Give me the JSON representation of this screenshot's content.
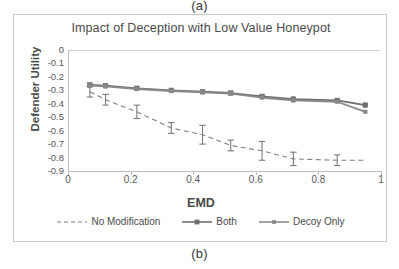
{
  "figure": {
    "caption_top": "(a)",
    "caption_bottom": "(b)"
  },
  "chart_data": {
    "type": "line",
    "title": "Impact of Deception with Low Value Honeypot",
    "xlabel": "EMD",
    "ylabel": "Defender Utility",
    "xlim": [
      0,
      1
    ],
    "ylim": [
      -0.9,
      0
    ],
    "xticks": [
      "0",
      "0.2",
      "0.4",
      "0.6",
      "0.8",
      "1"
    ],
    "xtick_values": [
      0,
      0.2,
      0.4,
      0.6,
      0.8,
      1
    ],
    "yticks": [
      "0",
      "-0.1",
      "-0.2",
      "-0.3",
      "-0.4",
      "-0.5",
      "-0.6",
      "-0.7",
      "-0.8",
      "-0.9"
    ],
    "ytick_values": [
      0,
      -0.1,
      -0.2,
      -0.3,
      -0.4,
      -0.5,
      -0.6,
      -0.7,
      -0.8,
      -0.9
    ],
    "grid": false,
    "legend_position": "bottom",
    "series": [
      {
        "name": "No Modification",
        "style": "dashed",
        "marker": "none",
        "color": "#7f7f7f",
        "error_bars": true,
        "x": [
          0.07,
          0.12,
          0.22,
          0.33,
          0.43,
          0.52,
          0.62,
          0.72,
          0.86,
          0.95
        ],
        "values": [
          -0.31,
          -0.37,
          -0.46,
          -0.58,
          -0.63,
          -0.71,
          -0.75,
          -0.81,
          -0.82,
          -0.82
        ],
        "yerr": [
          0.04,
          0.04,
          0.05,
          0.04,
          0.07,
          0.04,
          0.07,
          0.05,
          0.04,
          0.0
        ]
      },
      {
        "name": "Both",
        "style": "solid",
        "marker": "square",
        "color": "#6e6e6e",
        "error_bars": false,
        "x": [
          0.07,
          0.12,
          0.22,
          0.33,
          0.43,
          0.52,
          0.62,
          0.72,
          0.86,
          0.95
        ],
        "values": [
          -0.26,
          -0.265,
          -0.285,
          -0.3,
          -0.31,
          -0.32,
          -0.345,
          -0.365,
          -0.375,
          -0.41
        ]
      },
      {
        "name": "Decoy Only",
        "style": "solid",
        "marker": "small-square",
        "color": "#8a8a8a",
        "error_bars": false,
        "x": [
          0.07,
          0.12,
          0.22,
          0.33,
          0.43,
          0.52,
          0.62,
          0.72,
          0.86,
          0.95
        ],
        "values": [
          -0.265,
          -0.27,
          -0.29,
          -0.305,
          -0.315,
          -0.325,
          -0.355,
          -0.375,
          -0.385,
          -0.46
        ]
      }
    ]
  }
}
